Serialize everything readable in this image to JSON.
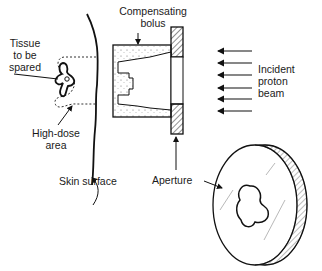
{
  "diagram": {
    "title": "",
    "labels": {
      "compensating_bolus_line1": "Compensating",
      "compensating_bolus_line2": "bolus",
      "tissue_line1": "Tissue",
      "tissue_line2": "to be",
      "tissue_line3": "spared",
      "high_dose_line1": "High-dose",
      "high_dose_line2": "area",
      "skin_surface": "Skin surface",
      "incident_line1": "Incident",
      "incident_line2": "proton",
      "incident_line3": "beam",
      "aperture": "Aperture"
    },
    "components": [
      "skin surface",
      "tissue to be spared",
      "high-dose area",
      "compensating bolus",
      "aperture",
      "incident proton beam"
    ],
    "beam_arrow_count": 6
  }
}
